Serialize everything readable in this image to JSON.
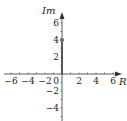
{
  "diagram": {
    "type": "complex-plane",
    "x_axis_label": "R",
    "y_axis_label": "Im",
    "x_ticks": [
      "−6",
      "−4",
      "−2",
      "0",
      "2",
      "4",
      "6"
    ],
    "x_tick_values": [
      -6,
      -4,
      -2,
      0,
      2,
      4,
      6
    ],
    "y_ticks": [
      "6",
      "4",
      "2",
      "−2",
      "−4"
    ],
    "y_tick_values": [
      6,
      4,
      2,
      -2,
      -4
    ],
    "xlim": [
      -6.5,
      7
    ],
    "ylim": [
      -6,
      7
    ],
    "point": {
      "re": 0,
      "im": 4
    },
    "vector_from": {
      "re": 0,
      "im": 0
    },
    "colors": {
      "axis": "#333333",
      "vector": "#555555",
      "point": "#777777"
    }
  }
}
